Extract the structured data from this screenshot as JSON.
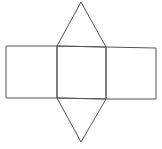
{
  "diagram": {
    "type": "net-triangular-prism",
    "stroke_color": "#555555",
    "background": "#ffffff",
    "shapes": [
      {
        "name": "left-square",
        "points": "6,46 57,46 57,98 6,98"
      },
      {
        "name": "center-square",
        "points": "57,46 106,47 106,99 57,98"
      },
      {
        "name": "right-square",
        "points": "106,47 156,48 156,99 106,99"
      },
      {
        "name": "top-triangle",
        "points": "57,46 81,2 106,47"
      },
      {
        "name": "bottom-triangle",
        "points": "57,98 81,142 106,99"
      }
    ]
  }
}
